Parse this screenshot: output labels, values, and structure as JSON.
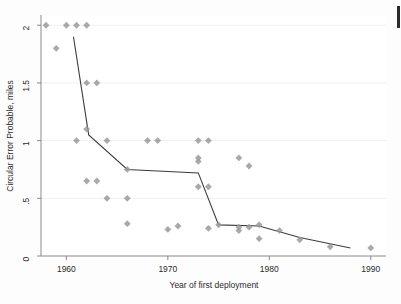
{
  "figure": {
    "background_color": "#fdfdfd",
    "plot_area_color": "#ffffff",
    "marker_color": "#9a9a9a",
    "line_color": "#3c3c3c",
    "grid_color": "#efefef",
    "axis_color": "#8a8a8a",
    "text_color": "#2b2b2b"
  },
  "chart_data": {
    "type": "scatter",
    "title": "",
    "xlabel": "Year of first deployment",
    "ylabel": "Circular Error Probable, miles",
    "xlim": [
      1957.5,
      1991.5
    ],
    "ylim": [
      0,
      2.08
    ],
    "xticks": [
      1960,
      1970,
      1980,
      1990
    ],
    "xtick_labels": [
      "1960",
      "1970",
      "1980",
      "1990"
    ],
    "yticks": [
      0,
      0.5,
      1,
      1.5,
      2
    ],
    "ytick_labels": [
      "0",
      ".5",
      "1",
      "1.5",
      "2"
    ],
    "grid": "horizontal",
    "legend": "none",
    "marker_shape": "diamond",
    "series": [
      {
        "name": "Circular Error Probable by year of first deployment",
        "type": "scatter",
        "points": [
          {
            "x": 1958,
            "y": 2.0
          },
          {
            "x": 1959,
            "y": 1.8
          },
          {
            "x": 1960,
            "y": 2.0
          },
          {
            "x": 1961,
            "y": 2.0
          },
          {
            "x": 1961,
            "y": 1.0
          },
          {
            "x": 1962,
            "y": 2.0
          },
          {
            "x": 1962,
            "y": 1.5
          },
          {
            "x": 1962,
            "y": 1.1
          },
          {
            "x": 1962,
            "y": 0.65
          },
          {
            "x": 1963,
            "y": 1.5
          },
          {
            "x": 1963,
            "y": 0.65
          },
          {
            "x": 1964,
            "y": 1.0
          },
          {
            "x": 1964,
            "y": 0.5
          },
          {
            "x": 1966,
            "y": 0.75
          },
          {
            "x": 1966,
            "y": 0.5
          },
          {
            "x": 1966,
            "y": 0.28
          },
          {
            "x": 1968,
            "y": 1.0
          },
          {
            "x": 1969,
            "y": 1.0
          },
          {
            "x": 1970,
            "y": 0.23
          },
          {
            "x": 1971,
            "y": 0.26
          },
          {
            "x": 1973,
            "y": 1.0
          },
          {
            "x": 1973,
            "y": 0.85
          },
          {
            "x": 1973,
            "y": 0.82
          },
          {
            "x": 1973,
            "y": 0.6
          },
          {
            "x": 1974,
            "y": 1.0
          },
          {
            "x": 1974,
            "y": 0.6
          },
          {
            "x": 1974,
            "y": 0.24
          },
          {
            "x": 1975,
            "y": 0.27
          },
          {
            "x": 1977,
            "y": 0.85
          },
          {
            "x": 1977,
            "y": 0.25
          },
          {
            "x": 1977,
            "y": 0.22
          },
          {
            "x": 1978,
            "y": 0.78
          },
          {
            "x": 1978,
            "y": 0.25
          },
          {
            "x": 1979,
            "y": 0.27
          },
          {
            "x": 1979,
            "y": 0.15
          },
          {
            "x": 1981,
            "y": 0.22
          },
          {
            "x": 1983,
            "y": 0.14
          },
          {
            "x": 1986,
            "y": 0.08
          },
          {
            "x": 1990,
            "y": 0.07
          }
        ]
      },
      {
        "name": "Piecewise trend line",
        "type": "line",
        "points": [
          {
            "x": 1960.7,
            "y": 1.9
          },
          {
            "x": 1962.2,
            "y": 1.05
          },
          {
            "x": 1966.0,
            "y": 0.75
          },
          {
            "x": 1973.0,
            "y": 0.72
          },
          {
            "x": 1975.0,
            "y": 0.27
          },
          {
            "x": 1979.0,
            "y": 0.26
          },
          {
            "x": 1983.0,
            "y": 0.16
          },
          {
            "x": 1988.0,
            "y": 0.07
          }
        ]
      }
    ]
  }
}
